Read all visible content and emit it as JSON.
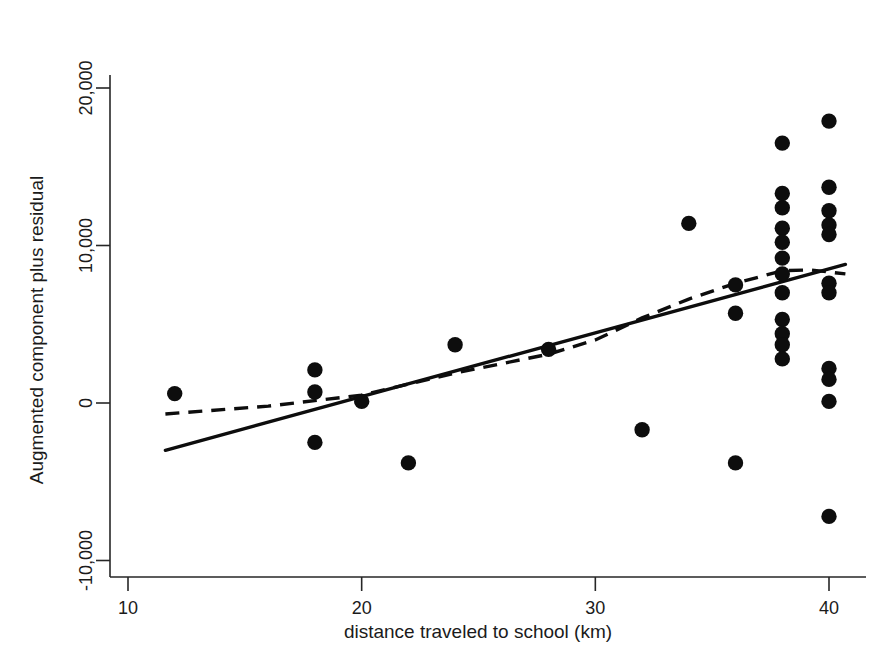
{
  "chart_data": {
    "type": "scatter",
    "title": "",
    "xlabel": "distance traveled to school (km)",
    "ylabel": "Augmented component plus residual",
    "xlim": [
      10,
      41.5
    ],
    "ylim": [
      -12500,
      21500
    ],
    "xticks": [
      10,
      20,
      30,
      40
    ],
    "xtick_labels": [
      "10",
      "20",
      "30",
      "40"
    ],
    "yticks": [
      -10000,
      0,
      10000,
      20000
    ],
    "ytick_labels": [
      "-10,000",
      "0",
      "10,000",
      "20,000"
    ],
    "grid": false,
    "legend": false,
    "marker_color": "#0d0d0d",
    "marker_size": 9,
    "points": [
      {
        "x": 12,
        "y": 600
      },
      {
        "x": 18,
        "y": 2100
      },
      {
        "x": 18,
        "y": 700
      },
      {
        "x": 18,
        "y": -2500
      },
      {
        "x": 20,
        "y": 100
      },
      {
        "x": 22,
        "y": -3800
      },
      {
        "x": 24,
        "y": 3700
      },
      {
        "x": 28,
        "y": 3400
      },
      {
        "x": 32,
        "y": -1700
      },
      {
        "x": 34,
        "y": 11400
      },
      {
        "x": 36,
        "y": 7500
      },
      {
        "x": 36,
        "y": 5700
      },
      {
        "x": 36,
        "y": -3800
      },
      {
        "x": 38,
        "y": 16500
      },
      {
        "x": 38,
        "y": 13300
      },
      {
        "x": 38,
        "y": 12400
      },
      {
        "x": 38,
        "y": 11100
      },
      {
        "x": 38,
        "y": 10200
      },
      {
        "x": 38,
        "y": 9200
      },
      {
        "x": 38,
        "y": 8200
      },
      {
        "x": 38,
        "y": 7000
      },
      {
        "x": 38,
        "y": 5300
      },
      {
        "x": 38,
        "y": 4400
      },
      {
        "x": 38,
        "y": 3700
      },
      {
        "x": 38,
        "y": 2800
      },
      {
        "x": 40,
        "y": 17900
      },
      {
        "x": 40,
        "y": 13700
      },
      {
        "x": 40,
        "y": 12200
      },
      {
        "x": 40,
        "y": 11300
      },
      {
        "x": 40,
        "y": 10700
      },
      {
        "x": 40,
        "y": 7600
      },
      {
        "x": 40,
        "y": 7000
      },
      {
        "x": 40,
        "y": 2200
      },
      {
        "x": 40,
        "y": 1500
      },
      {
        "x": 40,
        "y": 100
      },
      {
        "x": 40,
        "y": -7200
      }
    ],
    "series": [
      {
        "name": "linear-fit",
        "style": "solid",
        "points": [
          {
            "x": 11.6,
            "y": -3000
          },
          {
            "x": 40.7,
            "y": 8800
          }
        ]
      },
      {
        "name": "lowess-fit",
        "style": "dashed",
        "points": [
          {
            "x": 11.6,
            "y": -700
          },
          {
            "x": 16,
            "y": -200
          },
          {
            "x": 20,
            "y": 500
          },
          {
            "x": 24,
            "y": 1900
          },
          {
            "x": 26,
            "y": 2500
          },
          {
            "x": 28,
            "y": 3100
          },
          {
            "x": 30,
            "y": 4000
          },
          {
            "x": 32,
            "y": 5400
          },
          {
            "x": 34,
            "y": 6600
          },
          {
            "x": 36,
            "y": 7600
          },
          {
            "x": 38,
            "y": 8400
          },
          {
            "x": 39.2,
            "y": 8450
          },
          {
            "x": 40.7,
            "y": 8200
          }
        ]
      }
    ]
  }
}
